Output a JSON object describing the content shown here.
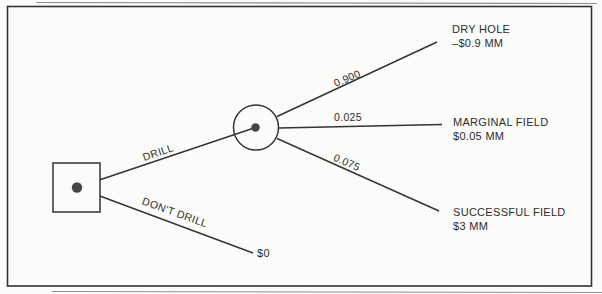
{
  "diagram": {
    "type": "decision-tree",
    "colors": {
      "ink": "#333333",
      "paper": "#fbfbf9"
    },
    "decision_branches": {
      "drill_label": "DRILL",
      "dont_drill_label": "DON'T DRILL",
      "dont_drill_payoff": "$0"
    },
    "chance_branches": [
      {
        "probability": "0.900",
        "outcome": "DRY HOLE",
        "payoff": "–$0.9 MM"
      },
      {
        "probability": "0.025",
        "outcome": "MARGINAL FIELD",
        "payoff": "$0.05 MM"
      },
      {
        "probability": "0.075",
        "outcome": "SUCCESSFUL FIELD",
        "payoff": "$3 MM"
      }
    ]
  }
}
